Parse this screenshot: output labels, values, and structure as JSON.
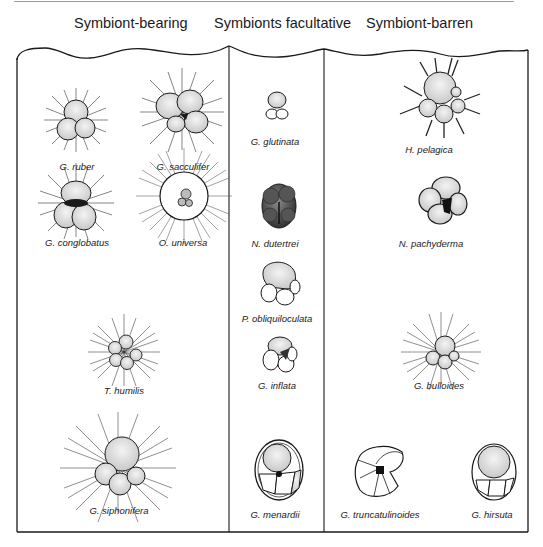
{
  "figure": {
    "columns": [
      {
        "title": "Symbiont-bearing"
      },
      {
        "title": "Symbionts facultative"
      },
      {
        "title": "Symbiont-barren"
      }
    ],
    "species": {
      "symbiont_bearing": [
        {
          "name": "G. ruber"
        },
        {
          "name": "G. sacculifer"
        },
        {
          "name": "G. conglobatus"
        },
        {
          "name": "O. universa"
        },
        {
          "name": "T. humilis"
        },
        {
          "name": "G. siphonifera"
        }
      ],
      "symbionts_facultative": [
        {
          "name": "G. glutinata"
        },
        {
          "name": "N. dutertrei"
        },
        {
          "name": "P. obliquiloculata"
        },
        {
          "name": "G. inflata"
        },
        {
          "name": "G. menardii"
        }
      ],
      "symbiont_barren": [
        {
          "name": "H. pelagica"
        },
        {
          "name": "N. pachyderma"
        },
        {
          "name": "G. bulloides"
        },
        {
          "name": "G. truncatulinoides"
        },
        {
          "name": "G. hirsuta"
        }
      ]
    },
    "colors": {
      "line": "#1a1a1a",
      "shading": "#6a6a6a",
      "background": "#ffffff"
    }
  }
}
